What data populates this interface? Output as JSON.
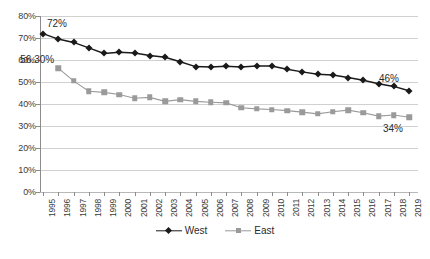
{
  "chart_data": {
    "type": "line",
    "title": "",
    "subtitle": "",
    "xlabel": "",
    "ylabel": "",
    "ylim": [
      0,
      80
    ],
    "ytick_labels": [
      "0%",
      "10%",
      "20%",
      "30%",
      "40%",
      "50%",
      "60%",
      "70%",
      "80%"
    ],
    "ytick_values": [
      0,
      10,
      20,
      30,
      40,
      50,
      60,
      70,
      80
    ],
    "grid": true,
    "legend_position": "bottom",
    "categories": [
      "1995",
      "1996",
      "1997",
      "1998",
      "1999",
      "2000",
      "2001",
      "2002",
      "2003",
      "2004",
      "2005",
      "2006",
      "2007",
      "2008",
      "2009",
      "2010",
      "2011",
      "2012",
      "2013",
      "2014",
      "2015",
      "2016",
      "2017",
      "2018",
      "2019"
    ],
    "series": [
      {
        "name": "West",
        "color": "#1a1a1a",
        "marker": "diamond",
        "values": [
          72.0,
          69.5,
          68.0,
          65.5,
          63.0,
          63.5,
          63.2,
          62.0,
          61.2,
          59.2,
          57.0,
          56.8,
          57.2,
          56.8,
          57.3,
          57.3,
          55.8,
          54.6,
          53.5,
          53.2,
          52.0,
          50.8,
          49.2,
          48.0,
          46.0
        ]
      },
      {
        "name": "East",
        "color": "#9a9a9a",
        "marker": "square",
        "values": [
          null,
          56.3,
          50.5,
          45.8,
          45.3,
          44.3,
          42.6,
          43.0,
          41.2,
          42.0,
          41.2,
          40.8,
          40.5,
          38.3,
          37.8,
          37.5,
          37.0,
          36.3,
          35.5,
          36.5,
          37.2,
          36.0,
          34.5,
          35.0,
          34.0
        ]
      }
    ],
    "annotations": [
      {
        "text": "72%",
        "series": "West",
        "category": "1995",
        "value": 72.0
      },
      {
        "text": "56.30%",
        "series": "East",
        "category": "1996",
        "value": 56.3
      },
      {
        "text": "46%",
        "series": "West",
        "category": "2019",
        "value": 46.0
      },
      {
        "text": "34%",
        "series": "East",
        "category": "2019",
        "value": 34.0
      }
    ]
  },
  "legend": {
    "entries": [
      {
        "label": "West"
      },
      {
        "label": "East"
      }
    ]
  },
  "colors": {
    "west": "#1a1a1a",
    "east": "#9a9a9a",
    "grid": "#d0d0d0",
    "axis": "#8c8c8c",
    "text": "#3a3a3a",
    "background": "#ffffff"
  }
}
